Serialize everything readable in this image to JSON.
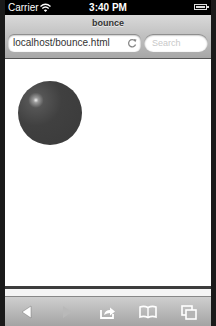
{
  "status_bar": {
    "carrier": "Carrier",
    "time": "3:40 PM",
    "wifi_icon": "wifi-icon",
    "battery_icon": "battery-icon"
  },
  "nav_bar": {
    "page_title": "bounce",
    "url_value": "localhost/bounce.html",
    "reload_icon": "reload-icon",
    "search_placeholder": "Search"
  },
  "content": {
    "ball": {
      "color": "#3f3f3f",
      "highlight": "#f2f2f2"
    }
  },
  "toolbar": {
    "items": [
      {
        "icon": "back-arrow-icon",
        "enabled": true
      },
      {
        "icon": "forward-arrow-icon",
        "enabled": false
      },
      {
        "icon": "share-icon",
        "enabled": true
      },
      {
        "icon": "bookmarks-icon",
        "enabled": true
      },
      {
        "icon": "tabs-icon",
        "enabled": true
      }
    ]
  }
}
